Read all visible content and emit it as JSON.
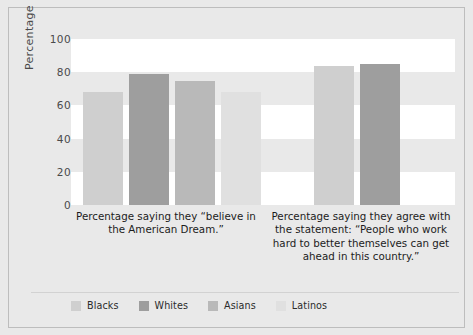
{
  "chart_data": {
    "type": "bar",
    "title": "",
    "xlabel": "",
    "ylabel": "Percentage",
    "ylim": [
      0,
      100
    ],
    "yticks": [
      0,
      20,
      40,
      60,
      80,
      100
    ],
    "ytick_labels": [
      "0",
      "20",
      "40",
      "60",
      "80",
      "100"
    ],
    "grid": "horizontal-bands",
    "legend_position": "bottom-left",
    "categories": [
      "Percentage saying they “believe in the American Dream.”",
      "Percentage saying they agree with the statement: “People who work hard to better themselves can get ahead in this country.”"
    ],
    "series": [
      {
        "name": "Blacks",
        "color": "#cfcfcf",
        "values": [
          68,
          null
        ]
      },
      {
        "name": "Whites",
        "color": "#9e9e9e",
        "values": [
          79,
          85
        ]
      },
      {
        "name": "Asians",
        "color": "#b9b9b9",
        "values": [
          75,
          84
        ]
      },
      {
        "name": "Latinos",
        "color": "#e0e0e0",
        "values": [
          68,
          null
        ]
      }
    ],
    "bars": [
      {
        "group": 0,
        "series": "Blacks",
        "value": 68,
        "color": "#cfcfcf",
        "x": 12,
        "width": 40
      },
      {
        "group": 0,
        "series": "Whites",
        "value": 79,
        "color": "#9e9e9e",
        "x": 58,
        "width": 40
      },
      {
        "group": 0,
        "series": "Asians",
        "value": 75,
        "color": "#b9b9b9",
        "x": 104,
        "width": 40
      },
      {
        "group": 0,
        "series": "Latinos",
        "value": 68,
        "color": "#e0e0e0",
        "x": 150,
        "width": 40
      },
      {
        "group": 1,
        "series": "Asians",
        "value": 84,
        "color": "#cfcfcf",
        "x": 243,
        "width": 40
      },
      {
        "group": 1,
        "series": "Whites",
        "value": 85,
        "color": "#9e9e9e",
        "x": 289,
        "width": 40
      }
    ]
  },
  "axis": {
    "ylabel": "Percentage",
    "ticks": [
      {
        "label": "100",
        "value": 100
      },
      {
        "label": "80",
        "value": 80
      },
      {
        "label": "60",
        "value": 60
      },
      {
        "label": "40",
        "value": 40
      },
      {
        "label": "20",
        "value": 20
      },
      {
        "label": "0",
        "value": 0
      }
    ]
  },
  "legend": {
    "items": [
      {
        "label": "Blacks",
        "color": "#cfcfcf"
      },
      {
        "label": "Whites",
        "color": "#9e9e9e"
      },
      {
        "label": "Asians",
        "color": "#b9b9b9"
      },
      {
        "label": "Latinos",
        "color": "#e0e0e0"
      }
    ]
  },
  "colors": {
    "figure_background": "#e9e9e9",
    "band": "#ffffff",
    "frame_border": "#bdbdbd",
    "text": "#1c1c1c",
    "axis_text": "#4a4a4a"
  }
}
